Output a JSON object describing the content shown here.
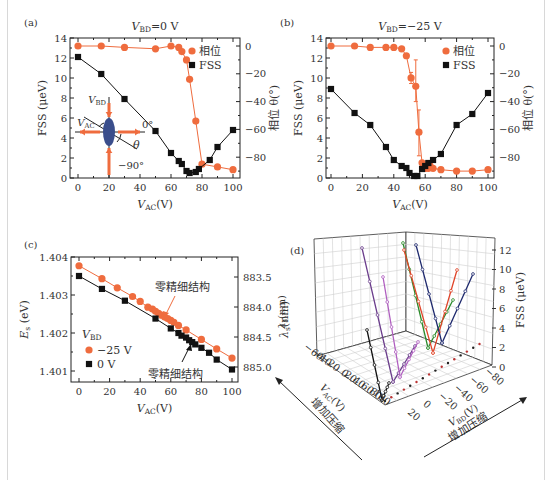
{
  "colors": {
    "phase": "#ef6c3e",
    "fss": "#111111",
    "ellipse": "#3a4e8c",
    "grid": "#cfcfcf"
  },
  "chart_data": [
    {
      "panel": "(a)",
      "type": "line",
      "title": "V_BD=0 V",
      "title_main": "V",
      "title_sub": "BD",
      "title_rest": "=0 V",
      "xlabel": "V_AC (V)",
      "ylabel": "FSS (μeV)",
      "y2label": "相位 θ(°)",
      "xlim": [
        0,
        100
      ],
      "ylim": [
        0,
        14
      ],
      "y2lim": [
        -95,
        3
      ],
      "xticks": [
        0,
        20,
        40,
        60,
        80,
        100
      ],
      "yticks": [
        0,
        2,
        4,
        6,
        8,
        10,
        12,
        14
      ],
      "y2ticks": [
        0,
        -20,
        -40,
        -60,
        -80
      ],
      "legend": [
        "相位",
        "FSS"
      ],
      "inset_labels": {
        "vbd": "V_BD",
        "vac": "V_AC",
        "zero": "0°",
        "minus90": "−90°",
        "theta": "θ"
      },
      "series": [
        {
          "name": "相位",
          "axis": "right",
          "x": [
            0,
            15,
            30,
            50,
            60,
            65,
            67,
            70,
            72,
            76,
            80,
            90,
            100
          ],
          "y": [
            0,
            0,
            -1,
            -2,
            0,
            -1,
            -4,
            -10,
            -24,
            -54,
            -85,
            -87,
            -89
          ]
        },
        {
          "name": "FSS",
          "axis": "left",
          "x": [
            0,
            15,
            30,
            50,
            60,
            65,
            67,
            70,
            72,
            76,
            78,
            85,
            90,
            100
          ],
          "y": [
            12.1,
            10.4,
            7.9,
            4.7,
            2.5,
            1.7,
            1.4,
            0.7,
            0.5,
            0.6,
            0.9,
            1.8,
            3.1,
            4.8
          ]
        }
      ]
    },
    {
      "panel": "(b)",
      "type": "line",
      "title": "V_BD=-25 V",
      "title_main": "V",
      "title_sub": "BD",
      "title_rest": "=−25 V",
      "xlabel": "V_AC (V)",
      "ylabel": "FSS (μeV)",
      "y2label": "相位 θ(°)",
      "xlim": [
        0,
        100
      ],
      "ylim": [
        0,
        14
      ],
      "y2lim": [
        -95,
        3
      ],
      "xticks": [
        0,
        20,
        40,
        60,
        80,
        100
      ],
      "yticks": [
        0,
        2,
        4,
        6,
        8,
        10,
        12,
        14
      ],
      "y2ticks": [
        0,
        -20,
        -40,
        -60,
        -80
      ],
      "legend": [
        "相位",
        "FSS"
      ],
      "series": [
        {
          "name": "相位",
          "axis": "right",
          "x": [
            0,
            15,
            25,
            35,
            40,
            45,
            48,
            51,
            54,
            56,
            58,
            60,
            62,
            63,
            65,
            70,
            80,
            90,
            100
          ],
          "y": [
            0,
            0,
            -1,
            -1,
            -1,
            -2,
            -7,
            -23,
            -29,
            -62,
            -84,
            -88,
            -88,
            -86,
            -88,
            -89,
            -90,
            -90,
            -89
          ],
          "error": {
            "x": [
              51,
              54,
              56
            ],
            "low": [
              -27,
              -40,
              -79
            ],
            "high": [
              -19,
              -10,
              -46
            ]
          }
        },
        {
          "name": "FSS",
          "axis": "left",
          "x": [
            0,
            15,
            25,
            35,
            40,
            45,
            48,
            50,
            53,
            55,
            58,
            60,
            62,
            65,
            70,
            80,
            90,
            100
          ],
          "y": [
            8.9,
            6.5,
            5.3,
            3.1,
            1.8,
            1.2,
            1.0,
            0.5,
            0.2,
            0.2,
            0.9,
            1.2,
            1.5,
            1.8,
            2.4,
            5.3,
            6.4,
            8.5
          ]
        }
      ]
    },
    {
      "panel": "(c)",
      "type": "line",
      "xlabel": "V_AC (V)",
      "ylabel": "E_s (eV)",
      "y2label": "λ_s(nm)",
      "xlim": [
        0,
        100
      ],
      "ylim": [
        1.4008,
        1.404
      ],
      "xticks": [
        0,
        20,
        40,
        60,
        80,
        100
      ],
      "yticks": [
        1.401,
        1.402,
        1.403,
        1.404
      ],
      "y2ticks": [
        "883.5",
        "884.0",
        "884.5",
        "885.0"
      ],
      "legend_title": "V_BD",
      "legend": [
        "−25 V",
        "0 V"
      ],
      "annotations": [
        "零精细结构",
        "零精细结构"
      ],
      "series": [
        {
          "name": "−25 V",
          "x": [
            0,
            15,
            25,
            35,
            40,
            45,
            48,
            50,
            52,
            54,
            56,
            58,
            60,
            62,
            65,
            70,
            80,
            90,
            100
          ],
          "y": [
            1.40377,
            1.40343,
            1.40319,
            1.40296,
            1.40283,
            1.40268,
            1.40263,
            1.40257,
            1.40252,
            1.40247,
            1.40242,
            1.40238,
            1.40233,
            1.40228,
            1.4022,
            1.40208,
            1.40183,
            1.40158,
            1.40134
          ]
        },
        {
          "name": "0 V",
          "x": [
            0,
            15,
            30,
            50,
            60,
            65,
            67,
            70,
            72,
            74,
            76,
            80,
            85,
            90,
            100
          ],
          "y": [
            1.4035,
            1.40316,
            1.40285,
            1.40238,
            1.40212,
            1.402,
            1.40193,
            1.40188,
            1.40181,
            1.40176,
            1.4017,
            1.40161,
            1.40148,
            1.4013,
            1.40104
          ]
        }
      ]
    },
    {
      "panel": "(d)",
      "type": "line3d",
      "xlabel": "V_AC (V)",
      "ylabel": "V_BD (V)",
      "zlabel": "FSS (μeV)",
      "wall_label": "λ_s(nm)",
      "arrow_labels": [
        "增加压缩",
        "增加压缩"
      ],
      "xticks": [
        -60,
        -40,
        -20,
        0,
        20,
        40,
        60,
        80,
        100
      ],
      "yticks": [
        20,
        0,
        -20,
        -40,
        -60,
        -80
      ],
      "zticks": [
        0,
        2,
        4,
        6,
        8,
        10,
        12
      ],
      "series_colors": [
        "#111111",
        "#6b3d8c",
        "#b05fc0",
        "#2a8a2a",
        "#e0452a",
        "#1f2a6e"
      ]
    }
  ],
  "labels": {
    "a": "(a)",
    "b": "(b)",
    "c": "(c)",
    "d": "(d)",
    "vac": "V",
    "vac_sub": "AC",
    "unit_v": "(V)",
    "fss_axis": "FSS (μeV)",
    "phase_axis": "相位 θ(°)",
    "es_axis": "E",
    "es_sub": "s",
    "es_unit": " (eV)",
    "lambda_axis": "λ",
    "lambda_sub": "s",
    "lambda_unit": "(nm)",
    "legend_phase": "相位",
    "legend_fss": "FSS",
    "legend_vbd": "V",
    "legend_vbd_sub": "BD",
    "legend_m25": "−25 V",
    "legend_0": "0 V",
    "zero_fss": "零精细结构",
    "compress": "增加压缩",
    "vbd_axis": "V",
    "vbd_sub": "BD",
    "fss_3d": "FSS (μeV)"
  }
}
